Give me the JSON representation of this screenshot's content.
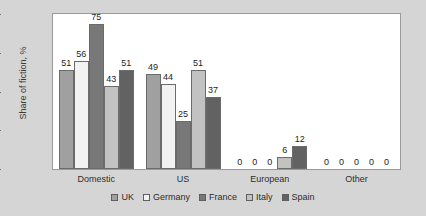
{
  "chart_data": {
    "type": "bar",
    "title": "",
    "xlabel": "",
    "ylabel": "Share of fiction, %",
    "ylim": [
      0,
      80
    ],
    "yticks": [
      0,
      20,
      40,
      60,
      80
    ],
    "grid": false,
    "legend_position": "bottom",
    "categories": [
      "Domestic",
      "US",
      "European",
      "Other"
    ],
    "series": [
      {
        "name": "UK",
        "color": "#a0a0a0",
        "values": [
          51,
          49,
          0,
          0
        ]
      },
      {
        "name": "Germany",
        "color": "#f2f2f2",
        "values": [
          56,
          44,
          0,
          0
        ]
      },
      {
        "name": "France",
        "color": "#787878",
        "values": [
          75,
          25,
          0,
          0
        ]
      },
      {
        "name": "Italy",
        "color": "#c2c2c2",
        "values": [
          43,
          51,
          6,
          0
        ]
      },
      {
        "name": "Spain",
        "color": "#626262",
        "values": [
          51,
          37,
          12,
          0
        ]
      }
    ]
  },
  "theme": {
    "page_background": "#d5d5d5",
    "plot_background": "#ffffff",
    "axis_color": "#9a9a9a",
    "text_color": "#2e2e2e"
  }
}
